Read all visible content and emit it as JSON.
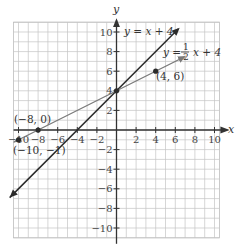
{
  "chart_data": {
    "type": "line",
    "title": "",
    "xlabel": "x",
    "ylabel": "y",
    "xlim": [
      -10.5,
      10.5
    ],
    "ylim": [
      -11,
      11
    ],
    "grid": true,
    "grid_step": 1,
    "x_ticks": [
      -10,
      -8,
      -6,
      -4,
      -2,
      2,
      4,
      6,
      8,
      10
    ],
    "x_tick_labels": [
      "−10",
      "−8",
      "−6",
      "−4",
      "−2",
      "2",
      "4",
      "6",
      "8",
      "10"
    ],
    "y_ticks": [
      10,
      8,
      6,
      4,
      2,
      -2,
      -4,
      -6,
      -8,
      -10
    ],
    "y_tick_labels": [
      "10",
      "8",
      "6",
      "4",
      "2",
      "−2",
      "−4",
      "−6",
      "−8",
      "−10"
    ],
    "series": [
      {
        "name": "y = x + 4",
        "equation": "y = x + 4",
        "slope": 1,
        "intercept": 4,
        "color": "#2b2b2b",
        "x": [
          -10.9,
          6.3
        ],
        "y": [
          -6.9,
          10.3
        ],
        "arrows": "both"
      },
      {
        "name": "y = 1/2 x + 4",
        "equation": "y = (1/2)x + 4",
        "slope": 0.5,
        "intercept": 4,
        "color": "#7a7a7a",
        "x": [
          -10.5,
          6.9
        ],
        "y": [
          -1.25,
          7.45
        ],
        "arrows": "both"
      }
    ],
    "points": [
      {
        "x": -8,
        "y": 0,
        "label": "(−8, 0)"
      },
      {
        "x": 4,
        "y": 6,
        "label": "(4, 6)"
      },
      {
        "x": -10,
        "y": -1,
        "label": "(−10, −1)"
      },
      {
        "x": 0,
        "y": 4,
        "label": ""
      }
    ],
    "annotations": [
      {
        "text": "y = x + 4",
        "near": [
          1,
          10
        ]
      },
      {
        "text": "y = 1/2 x + 4",
        "near": [
          6,
          8
        ]
      }
    ]
  },
  "labels": {
    "x_axis": "x",
    "y_axis": "y",
    "eq1_prefix": "y = x + 4",
    "eq2_y": "y =",
    "eq2_num": "1",
    "eq2_den": "2",
    "eq2_rest": "x + 4",
    "pt1": "(−8, 0)",
    "pt2": "(4, 6)",
    "pt3": "(−10, −1)"
  }
}
